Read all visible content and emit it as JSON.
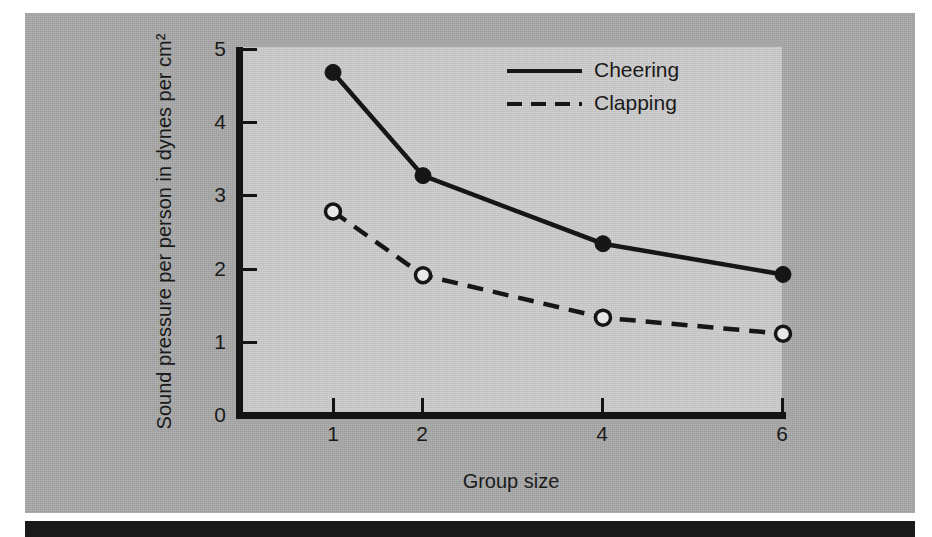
{
  "chart_data": {
    "type": "line",
    "title": "",
    "xlabel": "Group size",
    "ylabel": "Sound pressure per person in dynes per cm²",
    "x": [
      1,
      2,
      4,
      6
    ],
    "xtick_labels": [
      "1",
      "2",
      "4",
      "6"
    ],
    "ytick_labels": [
      "0",
      "1",
      "2",
      "3",
      "4",
      "5"
    ],
    "xlim": [
      0.5,
      6.5
    ],
    "ylim": [
      0,
      5
    ],
    "grid": false,
    "legend_position": "top-right-inside",
    "series": [
      {
        "name": "Cheering",
        "values": [
          4.68,
          3.27,
          2.34,
          1.92
        ],
        "line_style": "solid",
        "marker": "filled-circle",
        "color": "#161616"
      },
      {
        "name": "Clapping",
        "values": [
          2.78,
          1.91,
          1.33,
          1.11
        ],
        "line_style": "dashed",
        "marker": "open-circle",
        "color": "#161616"
      }
    ]
  },
  "axes": {
    "y_ticks": [
      {
        "label": "5"
      },
      {
        "label": "4"
      },
      {
        "label": "3"
      },
      {
        "label": "2"
      },
      {
        "label": "1"
      },
      {
        "label": "0"
      }
    ],
    "x_ticks": [
      {
        "label": "1"
      },
      {
        "label": "2"
      },
      {
        "label": "4"
      },
      {
        "label": "6"
      }
    ],
    "y_title": "Sound pressure per person in dynes per cm²",
    "x_title": "Group size"
  },
  "legend": {
    "entries": [
      {
        "label": "Cheering",
        "style": "solid"
      },
      {
        "label": "Clapping",
        "style": "dashed"
      }
    ]
  },
  "colors": {
    "page_background": "#ffffff",
    "panel_background": "#a8a8a8",
    "plot_background": "#c9c9c9",
    "ink": "#161616",
    "bottom_bar": "#1a1a1a"
  }
}
